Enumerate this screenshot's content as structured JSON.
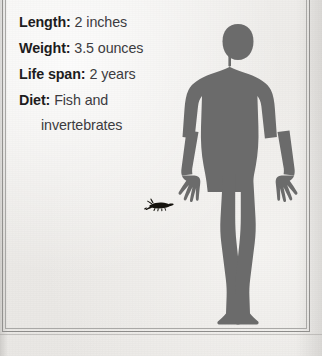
{
  "page": {
    "background_color": "#eceae7",
    "frame_color": "#8d8c8a",
    "silhouette_color": "#6b6b6b",
    "animal_color": "#16140f",
    "text_color": "#1d1c20"
  },
  "facts": [
    {
      "label": "Length:",
      "value": "2 inches",
      "continuation": ""
    },
    {
      "label": "Weight:",
      "value": "3.5 ounces",
      "continuation": ""
    },
    {
      "label": "Life span:",
      "value": "2 years",
      "continuation": ""
    },
    {
      "label": "Diet:",
      "value": "Fish and",
      "continuation": "invertebrates"
    }
  ],
  "figures": {
    "human_scale_reference": "human-silhouette",
    "animal_silhouette": "crustacean-silhouette"
  }
}
